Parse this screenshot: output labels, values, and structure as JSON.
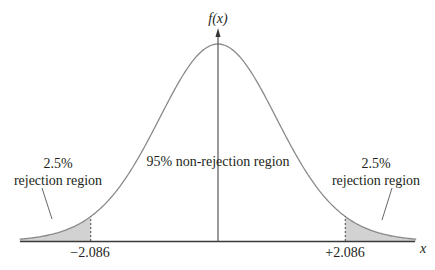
{
  "chart_data": {
    "type": "area",
    "title": "",
    "distribution": "t",
    "xlabel": "x",
    "ylabel": "f(x)",
    "critical_values": [
      -2.086,
      2.086
    ],
    "tick_labels": [
      "−2.086",
      "+2.086"
    ],
    "regions": [
      {
        "name": "left rejection region",
        "probability": 0.025,
        "x_range": [
          "-inf",
          -2.086
        ],
        "shaded": true
      },
      {
        "name": "non-rejection region",
        "probability": 0.95,
        "x_range": [
          -2.086,
          2.086
        ],
        "shaded": false
      },
      {
        "name": "right rejection region",
        "probability": 0.025,
        "x_range": [
          2.086,
          "inf"
        ],
        "shaded": true
      }
    ],
    "annotations": [
      "2.5% rejection region",
      "95% non-rejection region",
      "2.5% rejection region"
    ],
    "colors": {
      "curve": "#8a8a8a",
      "shade": "#d2d2d2",
      "axis": "#3a3a3a",
      "text": "#231f20"
    }
  },
  "labels": {
    "y_axis": "f(x)",
    "x_axis": "x",
    "left_tick": "−2.086",
    "right_tick": "+2.086",
    "left_pct": "2.5%",
    "left_region": "rejection region",
    "center": "95% non-rejection region",
    "right_pct": "2.5%",
    "right_region": "rejection region"
  }
}
